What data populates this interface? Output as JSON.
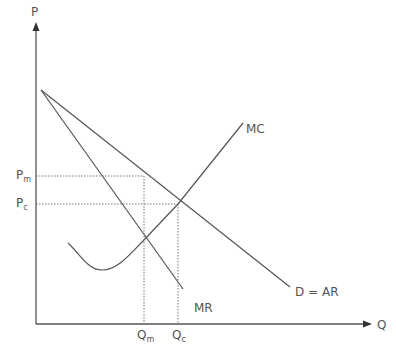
{
  "diagram": {
    "axes": {
      "y_label": "P",
      "x_label": "Q"
    },
    "curves": {
      "demand_label": "D = AR",
      "mr_label": "MR",
      "mc_label": "MC"
    },
    "price_levels": {
      "pm": {
        "main": "P",
        "sub": "m"
      },
      "pc": {
        "main": "P",
        "sub": "c"
      }
    },
    "quantity_levels": {
      "qm": {
        "main": "Q",
        "sub": "m"
      },
      "qc": {
        "main": "Q",
        "sub": "c"
      }
    },
    "colors": {
      "line": "#555555",
      "background": "#ffffff"
    }
  }
}
